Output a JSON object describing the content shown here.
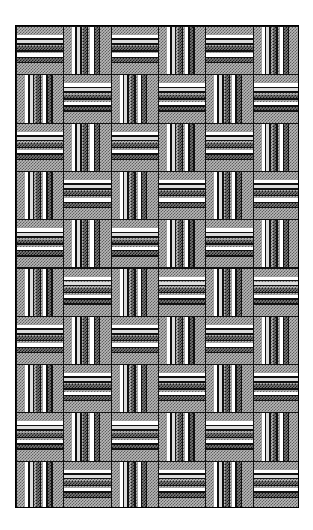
{
  "image": {
    "title": "Basket Weave Striped Tile Pattern",
    "description": "Monochrome textile / parquet basket-weave motif composed of square stippled tiles whose stripe bands alternate between horizontal and vertical orientation in a checkerboard arrangement.",
    "width": 313,
    "height": 530,
    "background_color": "#ffffff"
  },
  "pattern": {
    "name": "basket-weave",
    "frame": {
      "x": 15,
      "y": 25,
      "width": 284,
      "height": 483,
      "border_color": "#000000",
      "border_width": 1
    },
    "grid": {
      "columns": 6,
      "rows": 10,
      "cell_width": 47.33,
      "cell_height": 48.3,
      "tile_border_color": "#111111",
      "tile_border_width": 1,
      "orientation_rule": "checkerboard",
      "first_tile_orientation": "horizontal"
    },
    "tile": {
      "base_color": "#b9b9b9",
      "base_texture": "stipple-dot-mesh",
      "orientations": [
        "horizontal",
        "vertical"
      ]
    },
    "palette": {
      "white": "#ffffff",
      "light": "#dcdcdc",
      "mid": "#9a9a9a",
      "dark": "#4a4a4a",
      "black": "#111111",
      "base": "#b9b9b9",
      "stipple_dark": "#7a7a7a",
      "background": "#ffffff"
    },
    "bands": [
      {
        "offset_pct": 17.0,
        "size_pct": 7.0,
        "tone": "white"
      },
      {
        "offset_pct": 24.0,
        "size_pct": 3.5,
        "tone": "black"
      },
      {
        "offset_pct": 27.5,
        "size_pct": 6.5,
        "tone": "light"
      },
      {
        "offset_pct": 34.0,
        "size_pct": 3.5,
        "tone": "black"
      },
      {
        "offset_pct": 41.0,
        "size_pct": 8.0,
        "tone": "stipple-dark"
      },
      {
        "offset_pct": 49.0,
        "size_pct": 3.0,
        "tone": "black"
      },
      {
        "offset_pct": 56.0,
        "size_pct": 7.0,
        "tone": "white"
      },
      {
        "offset_pct": 63.0,
        "size_pct": 3.0,
        "tone": "black"
      },
      {
        "offset_pct": 66.0,
        "size_pct": 8.0,
        "tone": "stipple-dark"
      },
      {
        "offset_pct": 74.0,
        "size_pct": 3.0,
        "tone": "black"
      }
    ]
  }
}
